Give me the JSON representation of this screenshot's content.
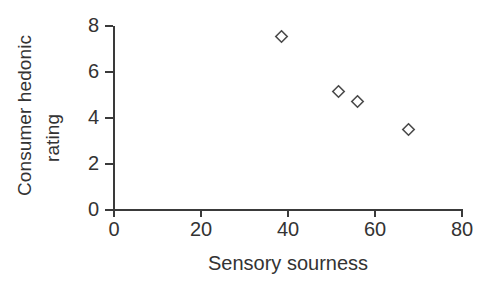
{
  "chart_data": {
    "type": "scatter",
    "title": "",
    "xlabel": "Sensory sourness",
    "ylabel": "Consumer hedonic rating",
    "ylabel_lines": [
      "Consumer hedonic",
      "rating"
    ],
    "xlim": [
      0,
      80
    ],
    "ylim": [
      0,
      8
    ],
    "xticks": [
      0,
      20,
      40,
      60,
      80
    ],
    "yticks": [
      0,
      2,
      4,
      6,
      8
    ],
    "xtick_labels": [
      "0",
      "20",
      "40",
      "60",
      "80"
    ],
    "ytick_labels": [
      "0",
      "2",
      "4",
      "6",
      "8"
    ],
    "grid": false,
    "legend": false,
    "marker": "open-diamond",
    "marker_color": "#4a4a4a",
    "axis_color": "#3a3a3a",
    "background": "#ffffff",
    "x": [
      38.4,
      51.7,
      55.9,
      67.8
    ],
    "y": [
      7.55,
      5.15,
      4.7,
      3.5
    ],
    "points": [
      {
        "x": 38.4,
        "y": 7.55
      },
      {
        "x": 51.7,
        "y": 5.15
      },
      {
        "x": 55.9,
        "y": 4.7
      },
      {
        "x": 67.8,
        "y": 3.5
      }
    ]
  },
  "axes": {
    "y_title_line_1": "Consumer hedonic",
    "y_title_line_2": "rating",
    "x_title": "Sensory sourness"
  }
}
